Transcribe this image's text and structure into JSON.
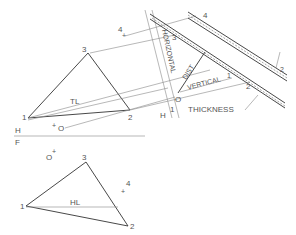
{
  "labels": {
    "top_view": {
      "p1": "1",
      "p2": "2",
      "p3": "3",
      "p4": "4",
      "o": "O",
      "line_label": "TL"
    },
    "front_view": {
      "p1": "1",
      "p2": "2",
      "p3": "3",
      "p4": "4",
      "o": "O",
      "line_label": "HL"
    },
    "fold_line": {
      "h": "H",
      "f": "F"
    },
    "aux_fold": {
      "h": "H",
      "one": "1"
    },
    "aux_view": {
      "p2": "2",
      "p3": "3",
      "p4": "4",
      "o": "O",
      "edge_one": "1",
      "edge_two": "2"
    },
    "annotations": {
      "horizontal": "HORIZONTAL",
      "vertical": "VERTICAL",
      "dist": "DIST",
      "thickness": "THICKNESS"
    }
  }
}
